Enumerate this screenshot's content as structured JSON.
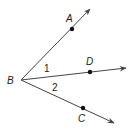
{
  "diagram": {
    "type": "geometry-angles",
    "vertex": {
      "label": "B",
      "x": 21,
      "y": 80
    },
    "rays": [
      {
        "name": "BA",
        "point_label": "A",
        "point": [
          72,
          29
        ],
        "tip": [
          90,
          9
        ],
        "label_pos": [
          66,
          22
        ]
      },
      {
        "name": "BD",
        "point_label": "D",
        "point": [
          90,
          72
        ],
        "tip": [
          126,
          68
        ],
        "label_pos": [
          86,
          65
        ]
      },
      {
        "name": "BC",
        "point_label": "C",
        "point": [
          83,
          108
        ],
        "tip": [
          114,
          123
        ],
        "label_pos": [
          78,
          122
        ]
      }
    ],
    "angles": [
      {
        "label": "1",
        "between": "BA-BD",
        "pos": [
          44,
          72
        ]
      },
      {
        "label": "2",
        "between": "BD-BC",
        "pos": [
          52,
          91
        ]
      }
    ],
    "colors": {
      "line": "#444444",
      "point": "#111111",
      "text": "#222222"
    }
  }
}
